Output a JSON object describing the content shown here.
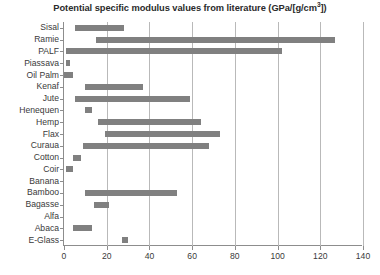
{
  "chart": {
    "title_text": "Potential specific modulus values from literature (GPa/[g/cm",
    "title_sup": "3",
    "title_tail": "])"
  },
  "chart_data": {
    "type": "bar",
    "orientation": "horizontal",
    "bar_style": "range",
    "title": "Potential specific modulus values from literature (GPa/[g/cm3])",
    "xlabel": "",
    "ylabel": "",
    "xlim": [
      0,
      140
    ],
    "xticks": [
      0,
      20,
      40,
      60,
      80,
      100,
      120,
      140
    ],
    "xticklabels": [
      "0",
      "20",
      "40",
      "60",
      "80",
      "100",
      "120",
      "140"
    ],
    "grid": "vertical",
    "legend": null,
    "bar_color": "#808080",
    "categories": [
      "Sisal",
      "Ramie",
      "PALF",
      "Piassava",
      "Oil Palm",
      "Kenaf",
      "Jute",
      "Henequen",
      "Hemp",
      "Flax",
      "Curaua",
      "Cotton",
      "Coir",
      "Banana",
      "Bamboo",
      "Bagasse",
      "Alfa",
      "Abaca",
      "E-Glass"
    ],
    "ranges": [
      [
        5,
        28
      ],
      [
        15,
        127
      ],
      [
        1,
        102
      ],
      [
        1,
        3
      ],
      [
        0,
        4
      ],
      [
        10,
        37
      ],
      [
        5,
        59
      ],
      [
        10,
        13
      ],
      [
        16,
        64
      ],
      [
        19,
        73
      ],
      [
        9,
        68
      ],
      [
        4,
        8
      ],
      [
        1,
        4
      ],
      null,
      [
        10,
        53
      ],
      [
        14,
        21
      ],
      null,
      [
        4,
        13
      ],
      [
        27,
        30
      ]
    ]
  }
}
